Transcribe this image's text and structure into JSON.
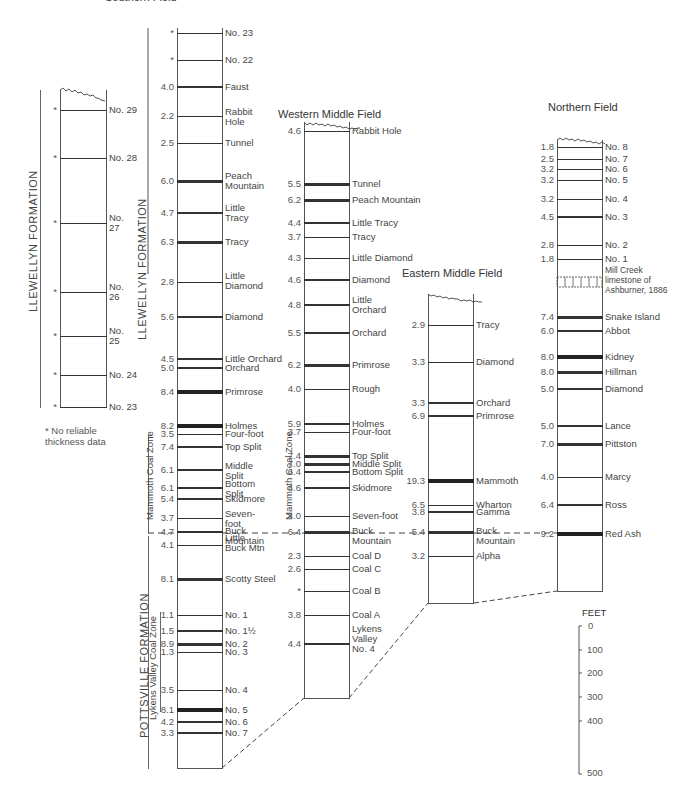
{
  "figure": {
    "top_title_fragment": "Southern Field",
    "footnote": "* No reliable\nthickness data",
    "scale": {
      "unit": "FEET",
      "ticks": [
        "0",
        "100",
        "200",
        "300",
        "400",
        "500"
      ]
    }
  },
  "formations": {
    "llewellyn_left": "LLEWELLYN FORMATION",
    "llewellyn_main": "LLEWELLYN FORMATION",
    "pottsville": "POTTSVILLE FORMATION",
    "mammoth_zone_southern": "Mammoth Coal Zone",
    "mammoth_zone_western": "Mammoth Coal Zone",
    "lykens_zone": "Lykens Valley Coal Zone"
  },
  "columns": {
    "southern_upper": {
      "title": "",
      "seams": [
        {
          "v": "*",
          "n": "No. 29"
        },
        {
          "v": "*",
          "n": "No. 28"
        },
        {
          "v": "*",
          "n": "No.\n27"
        },
        {
          "v": "*",
          "n": "No.\n26"
        },
        {
          "v": "*",
          "n": "No.\n25"
        },
        {
          "v": "*",
          "n": "No. 24"
        },
        {
          "v": "*",
          "n": "No. 23"
        }
      ]
    },
    "southern": {
      "title": "Southern Field",
      "seams": [
        {
          "v": "*",
          "n": "No. 23"
        },
        {
          "v": "*",
          "n": "No. 22"
        },
        {
          "v": "4.0",
          "n": "Faust"
        },
        {
          "v": "2.2",
          "n": "Rabbit\n Hole"
        },
        {
          "v": "2.5",
          "n": "Tunnel"
        },
        {
          "v": "6.0",
          "n": "Peach\nMountain"
        },
        {
          "v": "4.7",
          "n": "Little\nTracy"
        },
        {
          "v": "6.3",
          "n": "Tracy"
        },
        {
          "v": "2.8",
          "n": "   Little\nDiamond"
        },
        {
          "v": "5.6",
          "n": "Diamond"
        },
        {
          "v": "4.5",
          "n": "Little Orchard"
        },
        {
          "v": "5.0",
          "n": "Orchard"
        },
        {
          "v": "8.4",
          "n": "Primrose"
        },
        {
          "v": "8.2",
          "n": "Holmes"
        },
        {
          "v": "3.5",
          "n": "Four-foot"
        },
        {
          "v": "7.4",
          "n": "Top Split"
        },
        {
          "v": "6.1",
          "n": "Middle\n Split"
        },
        {
          "v": "6.1",
          "n": "Bottom\n Split"
        },
        {
          "v": "5.4",
          "n": "Skidmore"
        },
        {
          "v": "3.7",
          "n": "Seven-\n foot"
        },
        {
          "v": "4.7",
          "n": "  Buck\nMountain"
        },
        {
          "v": "4.1",
          "n": "   Little\nBuck Mtn"
        },
        {
          "v": "8.1",
          "n": "Scotty Steel"
        },
        {
          "v": "1.1",
          "n": "No. 1"
        },
        {
          "v": "1.5",
          "n": "No. 1½"
        },
        {
          "v": "8.9",
          "n": "No. 2"
        },
        {
          "v": "1.3",
          "n": "No. 3"
        },
        {
          "v": "3.5",
          "n": "No. 4"
        },
        {
          "v": "8.1",
          "n": "No. 5"
        },
        {
          "v": "4.2",
          "n": "No. 6"
        },
        {
          "v": "3.3",
          "n": "No. 7"
        }
      ]
    },
    "western": {
      "title": "Western Middle Field",
      "seams": [
        {
          "v": "4.6",
          "n": "Rabbit Hole"
        },
        {
          "v": "5.5",
          "n": "Tunnel"
        },
        {
          "v": "6.2",
          "n": "Peach Mountain"
        },
        {
          "v": "4.4",
          "n": "Little Tracy"
        },
        {
          "v": "3.7",
          "n": "Tracy"
        },
        {
          "v": "4.3",
          "n": "Little Diamond"
        },
        {
          "v": "4.6",
          "n": "Diamond"
        },
        {
          "v": "4.8",
          "n": "   Little\nOrchard"
        },
        {
          "v": "5.5",
          "n": "Orchard"
        },
        {
          "v": "6.2",
          "n": "Primrose"
        },
        {
          "v": "4.0",
          "n": "Rough"
        },
        {
          "v": "5.9",
          "n": "Holmes"
        },
        {
          "v": "3.7",
          "n": "Four-foot"
        },
        {
          "v": "7.4",
          "n": "Top Split"
        },
        {
          "v": "7.0",
          "n": "Middle Split"
        },
        {
          "v": "6.4",
          "n": "Bottom Split"
        },
        {
          "v": "4.6",
          "n": "Skidmore"
        },
        {
          "v": "4.0",
          "n": "Seven-foot"
        },
        {
          "v": "6.4",
          "n": "  Buck\nMountain"
        },
        {
          "v": "2.3",
          "n": "Coal D"
        },
        {
          "v": "2.6",
          "n": "Coal C"
        },
        {
          "v": "*",
          "n": "Coal B"
        },
        {
          "v": "3.8",
          "n": "Coal A"
        },
        {
          "v": "4.4",
          "n": "Lykens\nValley\nNo. 4"
        }
      ]
    },
    "eastern": {
      "title": "Eastern Middle Field",
      "seams": [
        {
          "v": "2.9",
          "n": "Tracy"
        },
        {
          "v": "3.3",
          "n": "Diamond"
        },
        {
          "v": "3.3",
          "n": "Orchard"
        },
        {
          "v": "6.9",
          "n": "Primrose"
        },
        {
          "v": "19.3",
          "n": "Mammoth"
        },
        {
          "v": "6.5",
          "n": "Wharton"
        },
        {
          "v": "3.8",
          "n": "Gamma"
        },
        {
          "v": "5.4",
          "n": "  Buck\nMountain"
        },
        {
          "v": "3.2",
          "n": "Alpha"
        }
      ]
    },
    "northern": {
      "title": "Northern Field",
      "seams": [
        {
          "v": "1.8",
          "n": "No. 8"
        },
        {
          "v": "2.5",
          "n": "No. 7"
        },
        {
          "v": "3.2",
          "n": "No. 6"
        },
        {
          "v": "3.2",
          "n": "No. 5"
        },
        {
          "v": "3.2",
          "n": "No. 4"
        },
        {
          "v": "4.5",
          "n": "No. 3"
        },
        {
          "v": "2.8",
          "n": "No. 2"
        },
        {
          "v": "1.8",
          "n": "No. 1"
        },
        {
          "v": "",
          "n": "Mill Creek\nlimestone of\nAshburner, 1886"
        },
        {
          "v": "7.4",
          "n": "Snake Island"
        },
        {
          "v": "6.0",
          "n": "Abbot"
        },
        {
          "v": "8.0",
          "n": "Kidney"
        },
        {
          "v": "8.0",
          "n": "Hillman"
        },
        {
          "v": "5.0",
          "n": "Diamond"
        },
        {
          "v": "5.0",
          "n": "Lance"
        },
        {
          "v": "7.0",
          "n": "Pittston"
        },
        {
          "v": "4.0",
          "n": "Marcy"
        },
        {
          "v": "6.4",
          "n": "Ross"
        },
        {
          "v": "9.2",
          "n": "Red Ash"
        }
      ]
    }
  }
}
